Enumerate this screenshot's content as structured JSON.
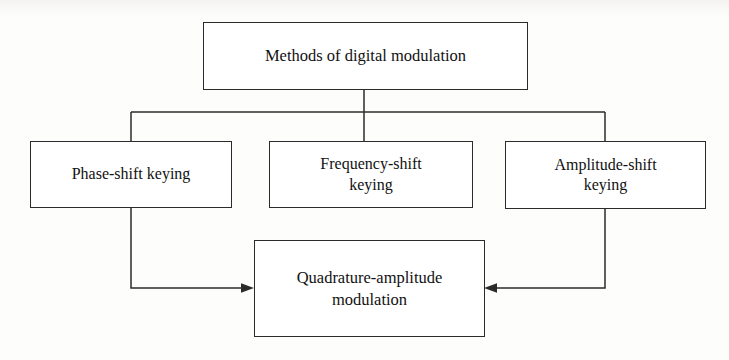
{
  "diagram": {
    "title": "Methods of digital modulation",
    "type": "hierarchy-tree-with-convergence",
    "stroke_color": "#2b2b2b",
    "background_color": "#fdfdfc",
    "nodes": [
      {
        "id": "root",
        "label": "Methods of digital modulation",
        "level": 0
      },
      {
        "id": "psk",
        "label": "Phase-shift keying",
        "level": 1
      },
      {
        "id": "fsk",
        "label": "Frequency-shift\nkeying",
        "level": 1
      },
      {
        "id": "ask",
        "label": "Amplitude-shift\nkeying",
        "level": 1
      },
      {
        "id": "qam",
        "label": "Quadrature-amplitude\nmodulation",
        "level": 2
      }
    ],
    "edges": [
      {
        "from": "root",
        "to": "psk",
        "style": "orthogonal",
        "arrowhead": "none"
      },
      {
        "from": "root",
        "to": "fsk",
        "style": "orthogonal",
        "arrowhead": "none"
      },
      {
        "from": "root",
        "to": "ask",
        "style": "orthogonal",
        "arrowhead": "none"
      },
      {
        "from": "psk",
        "to": "qam",
        "style": "orthogonal",
        "arrowhead": "right"
      },
      {
        "from": "ask",
        "to": "qam",
        "style": "orthogonal",
        "arrowhead": "left"
      }
    ]
  }
}
